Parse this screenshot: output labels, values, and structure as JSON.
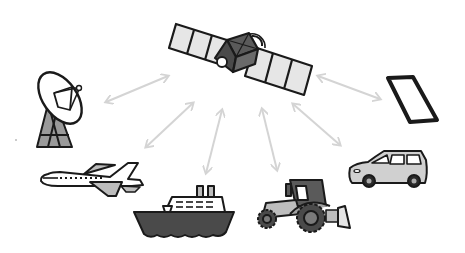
{
  "illustration": {
    "title": "Satellite communication network",
    "center": {
      "name": "satellite",
      "icon": "satellite-icon"
    },
    "nodes": [
      {
        "id": "ground-station",
        "label": "Ground station dish",
        "icon": "satellite-dish-icon"
      },
      {
        "id": "airplane",
        "label": "Airplane",
        "icon": "airplane-icon"
      },
      {
        "id": "ship",
        "label": "Cruise ship",
        "icon": "ship-icon"
      },
      {
        "id": "tractor",
        "label": "Tractor",
        "icon": "tractor-icon"
      },
      {
        "id": "car",
        "label": "Car",
        "icon": "car-icon"
      },
      {
        "id": "tablet",
        "label": "Tablet / smartphone",
        "icon": "tablet-icon"
      }
    ],
    "links": [
      {
        "from": "satellite",
        "to": "ground-station",
        "style": "bidirectional-arrow"
      },
      {
        "from": "satellite",
        "to": "airplane",
        "style": "bidirectional-arrow"
      },
      {
        "from": "satellite",
        "to": "ship",
        "style": "bidirectional-arrow"
      },
      {
        "from": "satellite",
        "to": "tractor",
        "style": "bidirectional-arrow"
      },
      {
        "from": "satellite",
        "to": "car",
        "style": "bidirectional-arrow"
      },
      {
        "from": "satellite",
        "to": "tablet",
        "style": "bidirectional-arrow"
      }
    ],
    "colors": {
      "outline": "#1a1a1a",
      "light_fill": "#e6e6e6",
      "mid_fill": "#b8b8b8",
      "dark_fill": "#5a5a5a",
      "arrow": "#d4d4d4",
      "background": "#ffffff"
    }
  }
}
